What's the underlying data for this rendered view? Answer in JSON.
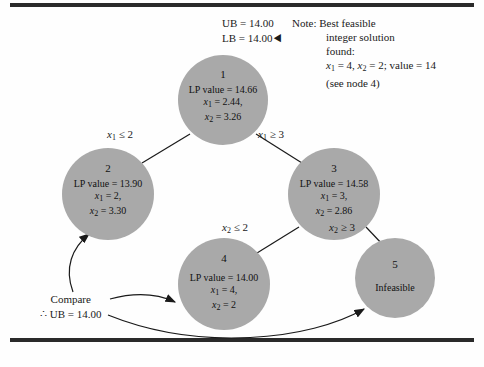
{
  "figure": {
    "type": "branch-and-bound-tree",
    "node_fill_color": "#a9a9a9",
    "line_color": "#1a1a1a",
    "background_color": "#ffffff"
  },
  "bounds": {
    "ub_label": "UB = 14.00",
    "lb_label": "LB = 14.00",
    "pointer_glyph": "◀"
  },
  "note": {
    "line1": "Note:  Best feasible",
    "line2": "integer solution",
    "line3": "found:",
    "line4_x1": "x",
    "line4_x1_sub": "1",
    "line4_mid": " = 4, ",
    "line4_x2": "x",
    "line4_x2_sub": "2",
    "line4_end": " = 2; value = 14",
    "line5": "(see node 4)"
  },
  "nodes": [
    {
      "id": "1",
      "number": "1",
      "lp_label": "LP value = 14.66",
      "x1_label": "x",
      "x1_sub": "1",
      "x1_value": " = 2.44,",
      "x2_label": "x",
      "x2_sub": "2",
      "x2_value": " = 3.26",
      "status": ""
    },
    {
      "id": "2",
      "number": "2",
      "lp_label": "LP value = 13.90",
      "x1_label": "x",
      "x1_sub": "1",
      "x1_value": " = 2,",
      "x2_label": "x",
      "x2_sub": "2",
      "x2_value": " = 3.30",
      "status": ""
    },
    {
      "id": "3",
      "number": "3",
      "lp_label": "LP value = 14.58",
      "x1_label": "x",
      "x1_sub": "1",
      "x1_value": " = 3,",
      "x2_label": "x",
      "x2_sub": "2",
      "x2_value": " = 2.86",
      "status": ""
    },
    {
      "id": "4",
      "number": "4",
      "lp_label": "LP value = 14.00",
      "x1_label": "x",
      "x1_sub": "1",
      "x1_value": " = 4,",
      "x2_label": "x",
      "x2_sub": "2",
      "x2_value": " = 2",
      "status": ""
    },
    {
      "id": "5",
      "number": "5",
      "lp_label": "",
      "x1_label": "",
      "x1_sub": "",
      "x1_value": "",
      "x2_label": "",
      "x2_sub": "",
      "x2_value": "",
      "status": "Infeasible"
    }
  ],
  "edges": {
    "label_1_2_var": "x",
    "label_1_2_sub": "1",
    "label_1_2_rel": " ≤ 2",
    "label_1_3_var": "x",
    "label_1_3_sub": "1",
    "label_1_3_rel": " ≥ 3",
    "label_3_4_var": "x",
    "label_3_4_sub": "2",
    "label_3_4_rel": " ≤ 2",
    "label_3_5_var": "x",
    "label_3_5_sub": "2",
    "label_3_5_rel": " ≥ 3"
  },
  "compare": {
    "line1": "Compare",
    "line2": "∴ UB = 14.00"
  }
}
